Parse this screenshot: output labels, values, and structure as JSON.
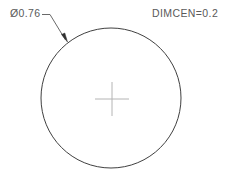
{
  "drawing": {
    "type": "cad-technical-drawing",
    "background_color": "#ffffff",
    "line_color": "#404040",
    "center_mark_color": "#b4b4b4",
    "text_color": "#5a5a5a",
    "dimension": {
      "label": "Ø0.76",
      "diameter_symbol": "Ø",
      "value": "0.76",
      "leader": {
        "stub_start_x": 42,
        "stub_start_y": 14,
        "stub_end_x": 50,
        "stub_end_y": 14,
        "arrow_tip_x": 67,
        "arrow_tip_y": 41
      }
    },
    "note": {
      "label": "DIMCEN=0.2",
      "variable": "DIMCEN",
      "value": "0.2"
    },
    "circle": {
      "center_x": 111,
      "center_y": 98,
      "radius": 70,
      "stroke_width": 1
    },
    "center_mark": {
      "center_x": 112,
      "center_y": 99,
      "arm_half_length": 17,
      "stroke_width": 1
    }
  }
}
